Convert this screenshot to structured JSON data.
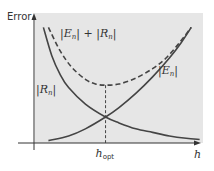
{
  "chart_data": {
    "type": "line",
    "title": "",
    "xlabel": "h",
    "ylabel": "Error",
    "xlim": [
      0,
      1
    ],
    "ylim": [
      0,
      1
    ],
    "grid": false,
    "background_color": "#e6e6e6",
    "annotations": [
      {
        "text": "h_opt",
        "base": "h",
        "sub": "opt",
        "x": 0.42,
        "kind": "vertical-dashed-marker"
      }
    ],
    "series": [
      {
        "name": "|R_n|",
        "label": "|R",
        "sub": "n",
        "style": "solid",
        "color": "#444444",
        "x": [
          0.05,
          0.1,
          0.15,
          0.2,
          0.3,
          0.42,
          0.5,
          0.6,
          0.7,
          0.8,
          0.9,
          0.98
        ],
        "y": [
          0.98,
          0.74,
          0.58,
          0.47,
          0.33,
          0.22,
          0.17,
          0.12,
          0.09,
          0.06,
          0.04,
          0.03
        ]
      },
      {
        "name": "|E_n|",
        "label": "|E",
        "sub": "n",
        "style": "solid",
        "color": "#444444",
        "x": [
          0.08,
          0.2,
          0.3,
          0.42,
          0.5,
          0.6,
          0.7,
          0.8,
          0.87,
          0.93
        ],
        "y": [
          0.02,
          0.06,
          0.12,
          0.22,
          0.3,
          0.42,
          0.56,
          0.72,
          0.85,
          0.98
        ]
      },
      {
        "name": "|E_n| + |R_n|",
        "label": "|E_n| + |R_n|",
        "style": "dashed",
        "color": "#444444",
        "x": [
          0.08,
          0.15,
          0.22,
          0.3,
          0.36,
          0.42,
          0.5,
          0.6,
          0.7,
          0.78,
          0.86,
          0.93
        ],
        "y": [
          0.98,
          0.78,
          0.64,
          0.54,
          0.5,
          0.49,
          0.5,
          0.55,
          0.63,
          0.72,
          0.85,
          0.98
        ]
      }
    ]
  }
}
